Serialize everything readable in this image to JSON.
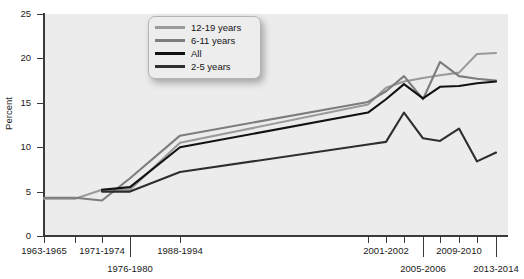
{
  "chart_data": {
    "type": "line",
    "title": "",
    "xlabel": "",
    "ylabel": "Percent",
    "ylim": [
      0,
      25
    ],
    "yticks": [
      0,
      5,
      10,
      15,
      20,
      25
    ],
    "grid": false,
    "legend_position": "top-left",
    "categories": [
      "1963-1965",
      "1966-1970",
      "1971-1974",
      "1976-1980",
      "1988-1994",
      "1999-2000",
      "2001-2002",
      "2003-2004",
      "2005-2006",
      "2007-2008",
      "2009-2010",
      "2011-2012",
      "2013-2014"
    ],
    "series": [
      {
        "name": "12-19 years",
        "color": "#9a9a9a",
        "values": [
          4.2,
          4.2,
          5.2,
          5.2,
          10.5,
          14.8,
          16.7,
          17.4,
          17.8,
          18.1,
          18.4,
          20.5,
          20.6
        ],
        "start_index": 0
      },
      {
        "name": "6-11 years",
        "color": "#7d7d7d",
        "values": [
          4.3,
          4.3,
          4.0,
          6.5,
          11.3,
          15.1,
          16.3,
          18.0,
          15.4,
          19.6,
          18.0,
          17.7,
          17.5
        ],
        "start_index": 0
      },
      {
        "name": "All",
        "color": "#111111",
        "values": [
          null,
          null,
          5.2,
          5.5,
          10.0,
          13.9,
          15.4,
          17.1,
          15.5,
          16.8,
          16.9,
          17.2,
          17.4
        ],
        "start_index": 2
      },
      {
        "name": "2-5 years",
        "color": "#2e2e2e",
        "values": [
          null,
          null,
          5.0,
          5.0,
          7.2,
          10.3,
          10.6,
          13.9,
          11.0,
          10.7,
          12.1,
          8.4,
          9.4
        ],
        "start_index": 2
      }
    ],
    "xtick_labels": [
      {
        "label": "1963-1965",
        "row": 0
      },
      {
        "label": "1971-1974",
        "row": 0
      },
      {
        "label": "1976-1980",
        "row": 1
      },
      {
        "label": "1988-1994",
        "row": 0
      },
      {
        "label": "2001-2002",
        "row": 0
      },
      {
        "label": "2005-2006",
        "row": 1
      },
      {
        "label": "2009-2010",
        "row": 0
      },
      {
        "label": "2013-2014",
        "row": 1
      }
    ]
  },
  "legend": {
    "items": [
      {
        "label": "12-19 years"
      },
      {
        "label": "6-11 years"
      },
      {
        "label": "All"
      },
      {
        "label": "2-5 years"
      }
    ]
  },
  "axis": {
    "y_title": "Percent",
    "y_labels": [
      "25",
      "20",
      "15",
      "10",
      "5",
      "0"
    ]
  }
}
